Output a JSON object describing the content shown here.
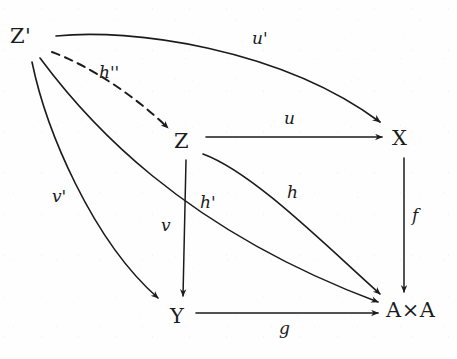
{
  "diagram": {
    "style": "hand-drawn pen on paper, scanned",
    "ink_color": "#1b1b1b",
    "paper_color": "#fefefe",
    "nodes": [
      {
        "id": "Zprime",
        "label": "Z'",
        "x": 28,
        "y": 38,
        "name": "node-z-prime"
      },
      {
        "id": "Z",
        "label": "Z",
        "x": 185,
        "y": 143,
        "name": "node-z"
      },
      {
        "id": "X",
        "label": "X",
        "x": 400,
        "y": 140,
        "name": "node-x"
      },
      {
        "id": "Y",
        "label": "Y",
        "x": 178,
        "y": 318,
        "name": "node-y"
      },
      {
        "id": "AxA",
        "label": "A×A",
        "x": 400,
        "y": 312,
        "name": "node-a-times-a"
      }
    ],
    "edges": [
      {
        "id": "uprime",
        "label": "u'",
        "from": "Zprime",
        "to": "X",
        "shape": "curve",
        "dashed": false,
        "label_x": 258,
        "label_y": 38,
        "name": "edge-u-prime"
      },
      {
        "id": "hdprime",
        "label": "h''",
        "from": "Zprime",
        "to": "Z",
        "shape": "line",
        "dashed": true,
        "label_x": 103,
        "label_y": 73,
        "name": "edge-h-double-prime"
      },
      {
        "id": "hprime",
        "label": "h'",
        "from": "Zprime",
        "to": "AxA",
        "shape": "curve",
        "dashed": false,
        "label_x": 206,
        "label_y": 203,
        "name": "edge-h-prime"
      },
      {
        "id": "vprime",
        "label": "v'",
        "from": "Zprime",
        "to": "Y",
        "shape": "curve",
        "dashed": false,
        "label_x": 58,
        "label_y": 196,
        "name": "edge-v-prime"
      },
      {
        "id": "u",
        "label": "u",
        "from": "Z",
        "to": "X",
        "shape": "line",
        "dashed": false,
        "label_x": 288,
        "label_y": 118,
        "name": "edge-u"
      },
      {
        "id": "h",
        "label": "h",
        "from": "Z",
        "to": "AxA",
        "shape": "curve",
        "dashed": false,
        "label_x": 290,
        "label_y": 192,
        "name": "edge-h"
      },
      {
        "id": "v",
        "label": "v",
        "from": "Z",
        "to": "Y",
        "shape": "line",
        "dashed": false,
        "label_x": 166,
        "label_y": 225,
        "name": "edge-v"
      },
      {
        "id": "f",
        "label": "f",
        "from": "X",
        "to": "AxA",
        "shape": "line",
        "dashed": false,
        "label_x": 416,
        "label_y": 215,
        "name": "edge-f"
      },
      {
        "id": "g",
        "label": "g",
        "from": "Y",
        "to": "AxA",
        "shape": "line",
        "dashed": false,
        "label_x": 283,
        "label_y": 328,
        "name": "edge-g"
      }
    ]
  }
}
